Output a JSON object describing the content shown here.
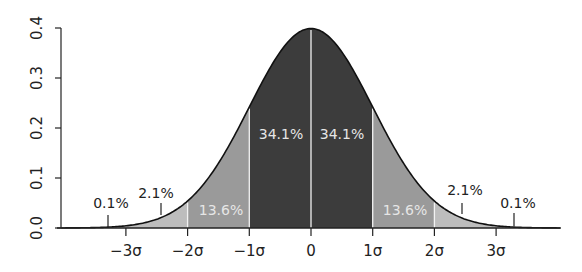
{
  "chart_data": {
    "type": "area",
    "title": "",
    "xlabel": "",
    "ylabel": "",
    "distribution": "standard normal",
    "xlim": [
      -4.05,
      4.0
    ],
    "ylim": [
      0.0,
      0.4
    ],
    "grid": false,
    "legend": null,
    "x_ticks": [
      {
        "value": -3,
        "label": "−3σ"
      },
      {
        "value": -2,
        "label": "−2σ"
      },
      {
        "value": -1,
        "label": "−1σ"
      },
      {
        "value": 0,
        "label": "0"
      },
      {
        "value": 1,
        "label": "1σ"
      },
      {
        "value": 2,
        "label": "2σ"
      },
      {
        "value": 3,
        "label": "3σ"
      }
    ],
    "y_ticks": [
      {
        "value": 0.0,
        "label": "0.0"
      },
      {
        "value": 0.1,
        "label": "0.1"
      },
      {
        "value": 0.2,
        "label": "0.2"
      },
      {
        "value": 0.3,
        "label": "0.3"
      },
      {
        "value": 0.4,
        "label": "0.4"
      }
    ],
    "regions": [
      {
        "from": -4,
        "to": -3,
        "percent": "0.1%",
        "fill": "#bdbdbd"
      },
      {
        "from": -3,
        "to": -2,
        "percent": "2.1%",
        "fill": "#bdbdbd"
      },
      {
        "from": -2,
        "to": -1,
        "percent": "13.6%",
        "fill": "#9a9a9a"
      },
      {
        "from": -1,
        "to": 0,
        "percent": "34.1%",
        "fill": "#3c3c3c"
      },
      {
        "from": 0,
        "to": 1,
        "percent": "34.1%",
        "fill": "#3c3c3c"
      },
      {
        "from": 1,
        "to": 2,
        "percent": "13.6%",
        "fill": "#9a9a9a"
      },
      {
        "from": 2,
        "to": 3,
        "percent": "2.1%",
        "fill": "#bdbdbd"
      },
      {
        "from": 3,
        "to": 4,
        "percent": "0.1%",
        "fill": "#bdbdbd"
      }
    ],
    "annotations": [
      {
        "label": "0.1%",
        "x": 111,
        "y": 208,
        "style": "light",
        "pointer_x": 108,
        "pointer_y1": 215,
        "pointer_y2": 227
      },
      {
        "label": "2.1%",
        "x": 156,
        "y": 198,
        "style": "light",
        "pointer_x": 161,
        "pointer_y1": 203,
        "pointer_y2": 215
      },
      {
        "label": "13.6%",
        "x": 221,
        "y": 215,
        "style": "dark"
      },
      {
        "label": "34.1%",
        "x": 281,
        "y": 139,
        "style": "dark"
      },
      {
        "label": "34.1%",
        "x": 342,
        "y": 139,
        "style": "dark"
      },
      {
        "label": "13.6%",
        "x": 405,
        "y": 215,
        "style": "dark"
      },
      {
        "label": "2.1%",
        "x": 465,
        "y": 195,
        "style": "light",
        "pointer_x": 462,
        "pointer_y1": 203,
        "pointer_y2": 214
      },
      {
        "label": "0.1%",
        "x": 518,
        "y": 208,
        "style": "light",
        "pointer_x": 514,
        "pointer_y1": 213,
        "pointer_y2": 226
      }
    ]
  },
  "layout": {
    "x0_px": 311,
    "sigma_px": 61.7,
    "y0_px": 228,
    "px_per_unit_y": 500,
    "axis_left_px": 61,
    "axis_right_px": 560,
    "curve_left_z": -4.05,
    "curve_right_z": 4.05
  }
}
